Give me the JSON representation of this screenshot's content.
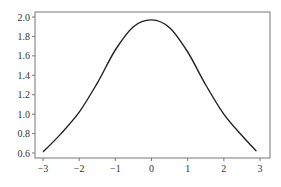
{
  "chart_data": {
    "type": "line",
    "title": "",
    "xlabel": "",
    "ylabel": "",
    "xlim": [
      -3.2,
      3.3
    ],
    "ylim": [
      0.55,
      2.05
    ],
    "xticks": [
      -3,
      -2,
      -1,
      0,
      1,
      2,
      3
    ],
    "xtick_labels": [
      "−3",
      "−2",
      "−1",
      "0",
      "1",
      "2",
      "3"
    ],
    "yticks": [
      0.6,
      0.8,
      1.0,
      1.2,
      1.4,
      1.6,
      1.8,
      2.0
    ],
    "ytick_labels": [
      "0.6",
      "0.8",
      "1.0",
      "1.2",
      "1.4",
      "1.6",
      "1.8",
      "2.0"
    ],
    "grid": false,
    "legend": null,
    "series": [
      {
        "name": "curve",
        "color": "#222222",
        "x": [
          -3.0,
          -2.5,
          -2.0,
          -1.5,
          -1.0,
          -0.5,
          0.0,
          0.5,
          1.0,
          1.5,
          2.0,
          2.5,
          2.9
        ],
        "y": [
          0.61,
          0.8,
          1.02,
          1.32,
          1.66,
          1.9,
          1.97,
          1.89,
          1.64,
          1.3,
          1.0,
          0.78,
          0.62
        ]
      }
    ]
  }
}
